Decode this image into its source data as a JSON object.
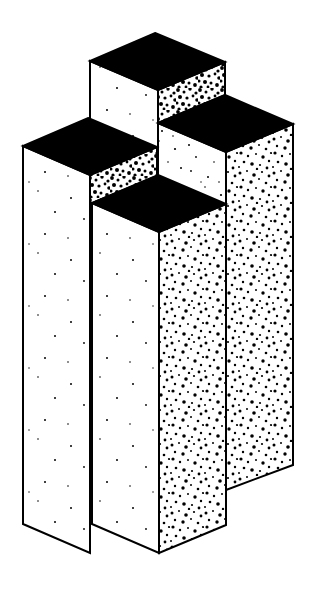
{
  "figure": {
    "title": "Isometric column cluster illustration",
    "canvas": {
      "width": 316,
      "height": 590,
      "background_color": "#FFFFFF",
      "ink_color": "#000000"
    },
    "style": {
      "top_face_fill": "#000000",
      "left_face_fill": "#FFFFFF",
      "right_face_fill": "#FFFFFF",
      "left_face_stipple_density": "sparse",
      "right_face_stipple_density": "dense",
      "stroke_color": "#000000",
      "stroke_width": 2,
      "projection": "isometric",
      "face_half_width": 67,
      "face_half_depth": 28
    },
    "columns": [
      {
        "id": "column-back-tall",
        "name": "tall back column",
        "top_apex": [
          155,
          33
        ],
        "left_vertex": [
          90,
          61
        ],
        "front_vertex": [
          158,
          90
        ],
        "right_vertex": [
          225,
          62
        ],
        "visible_faces": [
          "top",
          "left",
          "right"
        ],
        "right_face_visible_height": 33,
        "occluded": true
      },
      {
        "id": "column-left",
        "name": "left column",
        "top_apex": [
          88,
          118
        ],
        "left_vertex": [
          23,
          146
        ],
        "front_vertex": [
          90,
          175
        ],
        "right_vertex": [
          157,
          147
        ],
        "bottom_front_vertex": [
          90,
          553
        ],
        "bottom_left_vertex": [
          23,
          524
        ],
        "bottom_right_vertex": [
          157,
          525
        ],
        "visible_faces": [
          "top",
          "left",
          "right"
        ],
        "right_face_visible_height": 29,
        "occluded": true
      },
      {
        "id": "column-right",
        "name": "right column",
        "top_apex": [
          225,
          95
        ],
        "left_vertex": [
          158,
          123
        ],
        "front_vertex": [
          226,
          152
        ],
        "right_vertex": [
          293,
          124
        ],
        "bottom_front_vertex": [
          226,
          490
        ],
        "bottom_left_vertex": [
          158,
          464
        ],
        "bottom_right_vertex": [
          293,
          465
        ],
        "visible_faces": [
          "top",
          "left",
          "right"
        ],
        "occluded": false
      },
      {
        "id": "column-front-middle",
        "name": "front middle column",
        "top_apex": [
          158,
          175
        ],
        "left_vertex": [
          92,
          203
        ],
        "front_vertex": [
          159,
          232
        ],
        "right_vertex": [
          226,
          204
        ],
        "bottom_front_vertex": [
          159,
          553
        ],
        "bottom_left_vertex": [
          92,
          524
        ],
        "bottom_right_vertex": [
          226,
          525
        ],
        "visible_faces": [
          "top",
          "left",
          "right"
        ],
        "occluded": false
      }
    ],
    "notes": [
      "No text labels appear anywhere in the image.",
      "Gap of white background separates the right column base from the front middle column base."
    ]
  }
}
